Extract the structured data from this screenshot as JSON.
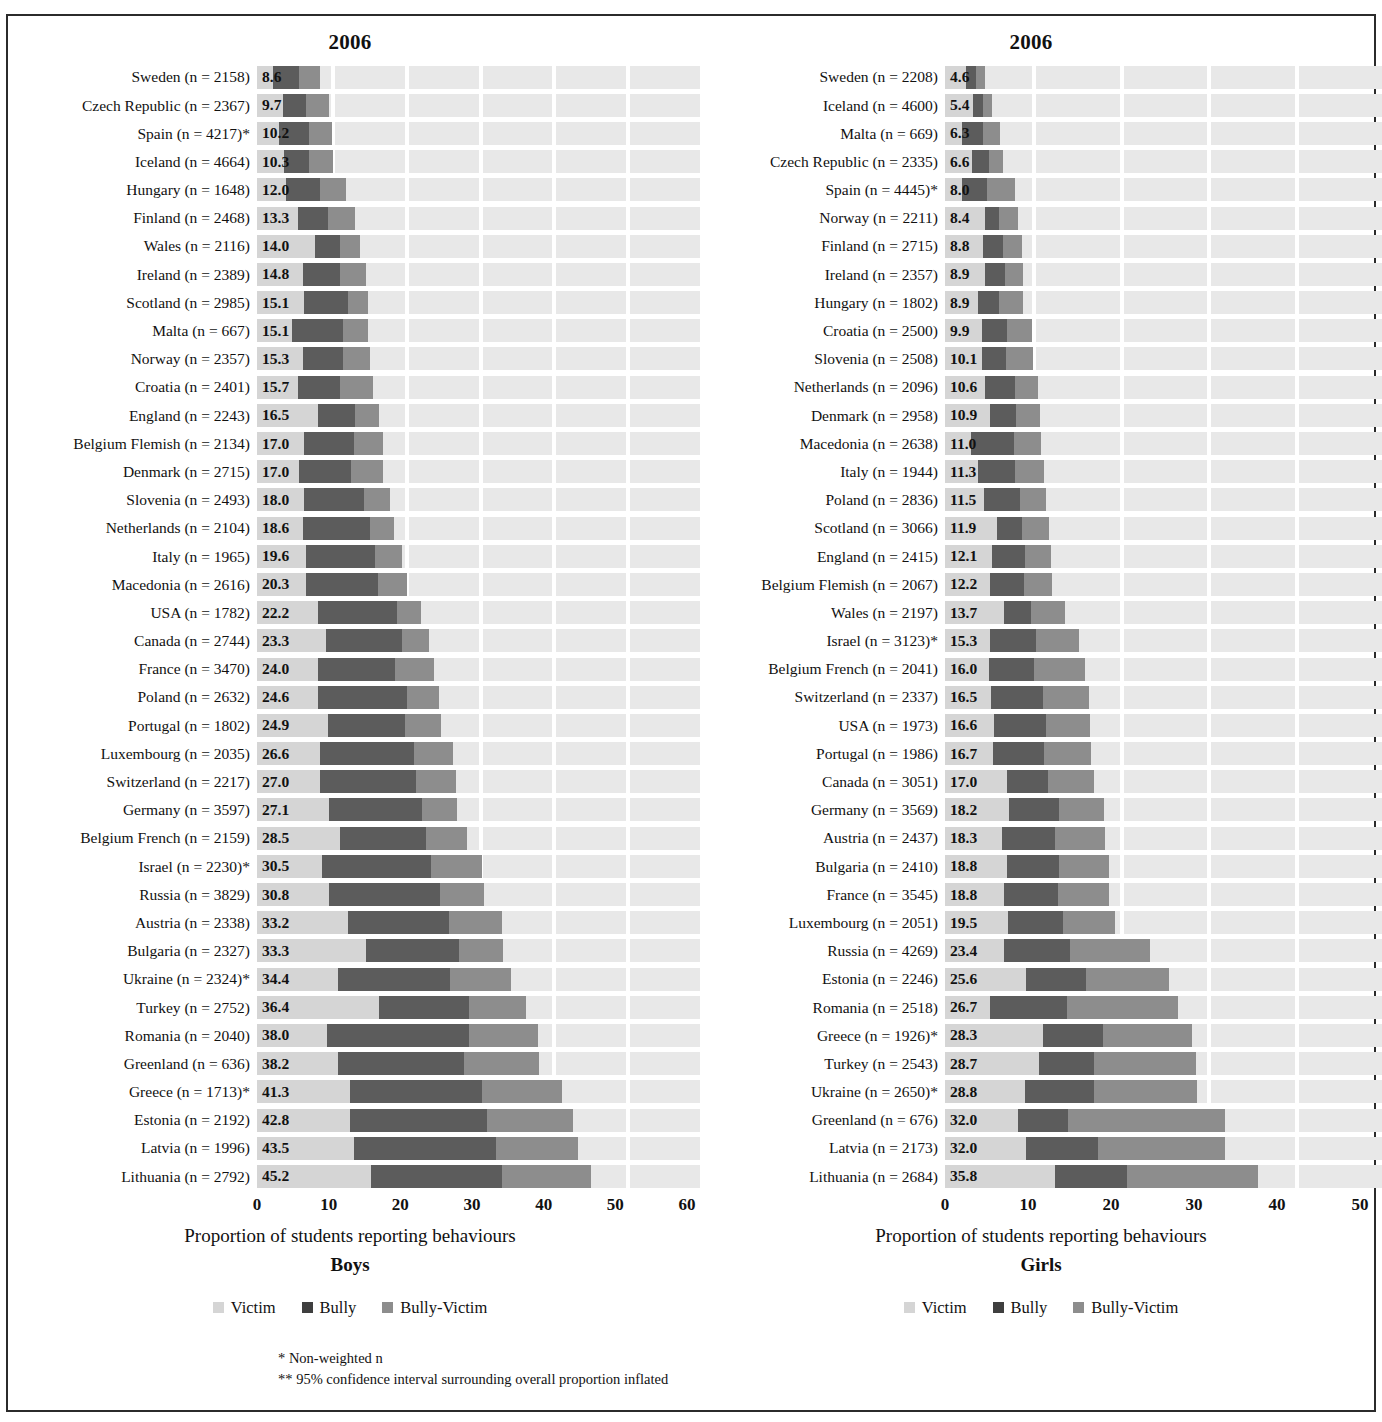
{
  "legend": {
    "victim": "Victim",
    "bully": "Bully",
    "bully_victim": "Bully-Victim"
  },
  "footnotes": {
    "line1": "* Non-weighted n",
    "line2": "** 95% confidence interval surrounding overall proportion inflated"
  },
  "colors": {
    "victim": "#d5d5d5",
    "bully": "#5c5c5c",
    "bully_victim": "#8d8d8d",
    "plot_background": "#e8e8e8",
    "gridline": "#ffffff"
  },
  "chart_data": [
    {
      "type": "bar",
      "orientation": "horizontal",
      "title": "2006",
      "panel_name": "Boys",
      "xlabel": "Proportion of students reporting behaviours",
      "ylabel": "",
      "xlim": [
        0,
        60
      ],
      "xticks": [
        0,
        10,
        20,
        30,
        40,
        50,
        60
      ],
      "grid": true,
      "legend_position": "bottom",
      "series_names": [
        "Victim",
        "Bully",
        "Bully-Victim"
      ],
      "categories": [
        "Sweden (n = 2158)",
        "Czech Republic (n = 2367)",
        "Spain (n = 4217)*",
        "Iceland (n = 4664)",
        "Hungary (n = 1648)",
        "Finland (n = 2468)",
        "Wales (n = 2116)",
        "Ireland (n = 2389)",
        "Scotland (n = 2985)",
        "Malta (n = 667)",
        "Norway (n = 2357)",
        "Croatia (n = 2401)",
        "England (n = 2243)",
        "Belgium Flemish (n = 2134)",
        "Denmark (n = 2715)",
        "Slovenia (n = 2493)",
        "Netherlands (n = 2104)",
        "Italy (n = 1965)",
        "Macedonia (n = 2616)",
        "USA (n = 1782)",
        "Canada (n = 2744)",
        "France (n = 3470)",
        "Poland (n = 2632)",
        "Portugal (n = 1802)",
        "Luxembourg (n = 2035)",
        "Switzerland (n = 2217)",
        "Germany (n = 3597)",
        "Belgium French (n = 2159)",
        "Israel (n = 2230)*",
        "Russia (n = 3829)",
        "Austria (n = 2338)",
        "Bulgaria (n = 2327)",
        "Ukraine (n = 2324)*",
        "Turkey (n = 2752)",
        "Romania (n = 2040)",
        "Greenland (n = 636)",
        "Greece (n = 1713)*",
        "Estonia (n = 2192)",
        "Latvia (n = 1996)",
        "Lithuania (n = 2792)"
      ],
      "values": [
        8.6,
        9.7,
        10.2,
        10.3,
        12.0,
        13.3,
        14.0,
        14.8,
        15.1,
        15.1,
        15.3,
        15.7,
        16.5,
        17.0,
        17.0,
        18.0,
        18.6,
        19.6,
        20.3,
        22.2,
        23.3,
        24.0,
        24.6,
        24.9,
        26.6,
        27.0,
        27.1,
        28.5,
        30.5,
        30.8,
        33.2,
        33.3,
        34.4,
        36.4,
        38.0,
        38.2,
        41.3,
        42.8,
        43.5,
        45.2
      ],
      "value_labels": [
        "8.6",
        "9.7",
        "10.2",
        "10.3",
        "12.0",
        "13.3",
        "14.0",
        "14.8",
        "15.1",
        "15.1",
        "15.3",
        "15.7",
        "16.5",
        "17.0",
        "17.0",
        "18.0",
        "18.6",
        "19.6",
        "20.3",
        "22.2",
        "23.3",
        "24.0",
        "24.6",
        "24.9",
        "26.6",
        "27.0",
        "27.1",
        "28.5",
        "30.5",
        "30.8",
        "33.2",
        "33.3",
        "34.4",
        "36.4",
        "38.0",
        "38.2",
        "41.3",
        "42.8",
        "43.5",
        "45.2"
      ],
      "segments": [
        {
          "bully_start": 2.2,
          "bully_end": 5.7,
          "bv_end": 8.6
        },
        {
          "bully_start": 3.5,
          "bully_end": 6.6,
          "bv_end": 9.7
        },
        {
          "bully_start": 3.0,
          "bully_end": 7.0,
          "bv_end": 10.2
        },
        {
          "bully_start": 3.6,
          "bully_end": 7.0,
          "bv_end": 10.3
        },
        {
          "bully_start": 3.9,
          "bully_end": 8.5,
          "bv_end": 12.0
        },
        {
          "bully_start": 5.5,
          "bully_end": 9.6,
          "bv_end": 13.3
        },
        {
          "bully_start": 7.9,
          "bully_end": 11.2,
          "bv_end": 14.0
        },
        {
          "bully_start": 6.2,
          "bully_end": 11.2,
          "bv_end": 14.8
        },
        {
          "bully_start": 6.3,
          "bully_end": 12.3,
          "bv_end": 15.1
        },
        {
          "bully_start": 4.7,
          "bully_end": 11.6,
          "bv_end": 15.1
        },
        {
          "bully_start": 6.2,
          "bully_end": 11.7,
          "bv_end": 15.3
        },
        {
          "bully_start": 5.5,
          "bully_end": 11.3,
          "bv_end": 15.7
        },
        {
          "bully_start": 8.3,
          "bully_end": 13.3,
          "bv_end": 16.5
        },
        {
          "bully_start": 6.3,
          "bully_end": 13.2,
          "bv_end": 17.0
        },
        {
          "bully_start": 5.7,
          "bully_end": 12.7,
          "bv_end": 17.0
        },
        {
          "bully_start": 6.3,
          "bully_end": 14.5,
          "bv_end": 18.0
        },
        {
          "bully_start": 6.2,
          "bully_end": 15.3,
          "bv_end": 18.6
        },
        {
          "bully_start": 6.7,
          "bully_end": 16.0,
          "bv_end": 19.6
        },
        {
          "bully_start": 6.6,
          "bully_end": 16.4,
          "bv_end": 20.3
        },
        {
          "bully_start": 8.2,
          "bully_end": 19.0,
          "bv_end": 22.2
        },
        {
          "bully_start": 9.4,
          "bully_end": 19.6,
          "bv_end": 23.3
        },
        {
          "bully_start": 8.2,
          "bully_end": 18.7,
          "bv_end": 24.0
        },
        {
          "bully_start": 8.2,
          "bully_end": 20.3,
          "bv_end": 24.6
        },
        {
          "bully_start": 9.6,
          "bully_end": 20.1,
          "bv_end": 24.9
        },
        {
          "bully_start": 8.6,
          "bully_end": 21.3,
          "bv_end": 26.6
        },
        {
          "bully_start": 8.5,
          "bully_end": 21.5,
          "bv_end": 27.0
        },
        {
          "bully_start": 9.8,
          "bully_end": 22.3,
          "bv_end": 27.1
        },
        {
          "bully_start": 11.2,
          "bully_end": 22.9,
          "bv_end": 28.5
        },
        {
          "bully_start": 8.8,
          "bully_end": 23.6,
          "bv_end": 30.5
        },
        {
          "bully_start": 9.7,
          "bully_end": 24.8,
          "bv_end": 30.8
        },
        {
          "bully_start": 12.3,
          "bully_end": 26.0,
          "bv_end": 33.2
        },
        {
          "bully_start": 14.7,
          "bully_end": 27.4,
          "bv_end": 33.3
        },
        {
          "bully_start": 11.0,
          "bully_end": 26.1,
          "bv_end": 34.4
        },
        {
          "bully_start": 16.5,
          "bully_end": 28.7,
          "bv_end": 36.4
        },
        {
          "bully_start": 9.5,
          "bully_end": 28.7,
          "bv_end": 38.0
        },
        {
          "bully_start": 11.0,
          "bully_end": 28.0,
          "bv_end": 38.2
        },
        {
          "bully_start": 12.6,
          "bully_end": 30.5,
          "bv_end": 41.3
        },
        {
          "bully_start": 12.6,
          "bully_end": 31.2,
          "bv_end": 42.8
        },
        {
          "bully_start": 13.1,
          "bully_end": 32.4,
          "bv_end": 43.5
        },
        {
          "bully_start": 15.4,
          "bully_end": 33.2,
          "bv_end": 45.2
        }
      ]
    },
    {
      "type": "bar",
      "orientation": "horizontal",
      "title": "2006",
      "panel_name": "Girls",
      "xlabel": "Proportion of students reporting behaviours",
      "ylabel": "",
      "xlim": [
        0,
        50
      ],
      "xticks": [
        0,
        10,
        20,
        30,
        40,
        50
      ],
      "grid": true,
      "legend_position": "bottom",
      "series_names": [
        "Victim",
        "Bully",
        "Bully-Victim"
      ],
      "categories": [
        "Sweden (n = 2208)",
        "Iceland (n = 4600)",
        "Malta (n = 669)",
        "Czech Republic (n = 2335)",
        "Spain (n = 4445)*",
        "Norway (n = 2211)",
        "Finland (n = 2715)",
        "Ireland (n = 2357)",
        "Hungary (n = 1802)",
        "Croatia (n = 2500)",
        "Slovenia (n = 2508)",
        "Netherlands (n = 2096)",
        "Denmark (n = 2958)",
        "Macedonia (n = 2638)",
        "Italy (n = 1944)",
        "Poland (n = 2836)",
        "Scotland (n = 3066)",
        "England (n = 2415)",
        "Belgium Flemish (n = 2067)",
        "Wales (n = 2197)",
        "Israel (n = 3123)*",
        "Belgium French (n = 2041)",
        "Switzerland (n = 2337)",
        "USA (n = 1973)",
        "Portugal (n = 1986)",
        "Canada (n = 3051)",
        "Germany (n = 3569)",
        "Austria (n = 2437)",
        "Bulgaria (n = 2410)",
        "France (n = 3545)",
        "Luxembourg (n = 2051)",
        "Russia (n = 4269)",
        "Estonia (n = 2246)",
        "Romania (n = 2518)",
        "Greece (n = 1926)*",
        "Turkey (n = 2543)",
        "Ukraine (n = 2650)*",
        "Greenland (n = 676)",
        "Latvia (n = 2173)",
        "Lithuania (n = 2684)"
      ],
      "values": [
        4.6,
        5.4,
        6.3,
        6.6,
        8.0,
        8.4,
        8.8,
        8.9,
        8.9,
        9.9,
        10.1,
        10.6,
        10.9,
        11.0,
        11.3,
        11.5,
        11.9,
        12.1,
        12.2,
        13.7,
        15.3,
        16.0,
        16.5,
        16.6,
        16.7,
        17.0,
        18.2,
        18.3,
        18.8,
        18.8,
        19.5,
        23.4,
        25.6,
        26.7,
        28.3,
        28.7,
        28.8,
        32.0,
        32.0,
        35.8
      ],
      "value_labels": [
        "4.6",
        "5.4",
        "6.3",
        "6.6",
        "8.0",
        "8.4",
        "8.8",
        "8.9",
        "8.9",
        "9.9",
        "10.1",
        "10.6",
        "10.9",
        "11.0",
        "11.3",
        "11.5",
        "11.9",
        "12.1",
        "12.2",
        "13.7",
        "15.3",
        "16.0",
        "16.5",
        "16.6",
        "16.7",
        "17.0",
        "18.2",
        "18.3",
        "18.8",
        "18.8",
        "19.5",
        "23.4",
        "25.6",
        "26.7",
        "28.3",
        "28.7",
        "28.8",
        "32.0",
        "32.0",
        "35.8"
      ],
      "segments": [
        {
          "bully_start": 2.4,
          "bully_end": 3.6,
          "bv_end": 4.6
        },
        {
          "bully_start": 3.2,
          "bully_end": 4.4,
          "bv_end": 5.4
        },
        {
          "bully_start": 2.0,
          "bully_end": 4.4,
          "bv_end": 6.3
        },
        {
          "bully_start": 3.1,
          "bully_end": 5.0,
          "bv_end": 6.6
        },
        {
          "bully_start": 1.9,
          "bully_end": 4.8,
          "bv_end": 8.0
        },
        {
          "bully_start": 4.6,
          "bully_end": 6.2,
          "bv_end": 8.4
        },
        {
          "bully_start": 4.3,
          "bully_end": 6.6,
          "bv_end": 8.8
        },
        {
          "bully_start": 4.6,
          "bully_end": 6.9,
          "bv_end": 8.9
        },
        {
          "bully_start": 3.8,
          "bully_end": 6.2,
          "bv_end": 8.9
        },
        {
          "bully_start": 4.2,
          "bully_end": 7.1,
          "bv_end": 9.9
        },
        {
          "bully_start": 4.2,
          "bully_end": 7.0,
          "bv_end": 10.1
        },
        {
          "bully_start": 4.6,
          "bully_end": 8.0,
          "bv_end": 10.6
        },
        {
          "bully_start": 5.2,
          "bully_end": 8.1,
          "bv_end": 10.9
        },
        {
          "bully_start": 3.0,
          "bully_end": 7.9,
          "bv_end": 11.0
        },
        {
          "bully_start": 3.8,
          "bully_end": 8.0,
          "bv_end": 11.3
        },
        {
          "bully_start": 4.5,
          "bully_end": 8.6,
          "bv_end": 11.5
        },
        {
          "bully_start": 6.0,
          "bully_end": 8.8,
          "bv_end": 11.9
        },
        {
          "bully_start": 5.4,
          "bully_end": 9.1,
          "bv_end": 12.1
        },
        {
          "bully_start": 5.1,
          "bully_end": 9.0,
          "bv_end": 12.2
        },
        {
          "bully_start": 6.7,
          "bully_end": 9.8,
          "bv_end": 13.7
        },
        {
          "bully_start": 5.1,
          "bully_end": 10.4,
          "bv_end": 15.3
        },
        {
          "bully_start": 5.0,
          "bully_end": 10.2,
          "bv_end": 16.0
        },
        {
          "bully_start": 5.3,
          "bully_end": 11.2,
          "bv_end": 16.5
        },
        {
          "bully_start": 5.6,
          "bully_end": 11.6,
          "bv_end": 16.6
        },
        {
          "bully_start": 5.5,
          "bully_end": 11.3,
          "bv_end": 16.7
        },
        {
          "bully_start": 7.1,
          "bully_end": 11.8,
          "bv_end": 17.0
        },
        {
          "bully_start": 7.3,
          "bully_end": 13.0,
          "bv_end": 18.2
        },
        {
          "bully_start": 6.5,
          "bully_end": 12.6,
          "bv_end": 18.3
        },
        {
          "bully_start": 7.1,
          "bully_end": 13.1,
          "bv_end": 18.8
        },
        {
          "bully_start": 6.8,
          "bully_end": 12.9,
          "bv_end": 18.8
        },
        {
          "bully_start": 7.2,
          "bully_end": 13.5,
          "bv_end": 19.5
        },
        {
          "bully_start": 6.7,
          "bully_end": 14.3,
          "bv_end": 23.4
        },
        {
          "bully_start": 9.3,
          "bully_end": 16.1,
          "bv_end": 25.6
        },
        {
          "bully_start": 5.1,
          "bully_end": 14.0,
          "bv_end": 26.7
        },
        {
          "bully_start": 11.2,
          "bully_end": 18.1,
          "bv_end": 28.3
        },
        {
          "bully_start": 10.8,
          "bully_end": 17.1,
          "bv_end": 28.7
        },
        {
          "bully_start": 9.1,
          "bully_end": 17.0,
          "bv_end": 28.8
        },
        {
          "bully_start": 8.4,
          "bully_end": 14.1,
          "bv_end": 32.0
        },
        {
          "bully_start": 9.3,
          "bully_end": 17.5,
          "bv_end": 32.0
        },
        {
          "bully_start": 12.6,
          "bully_end": 20.8,
          "bv_end": 35.8
        }
      ]
    }
  ]
}
